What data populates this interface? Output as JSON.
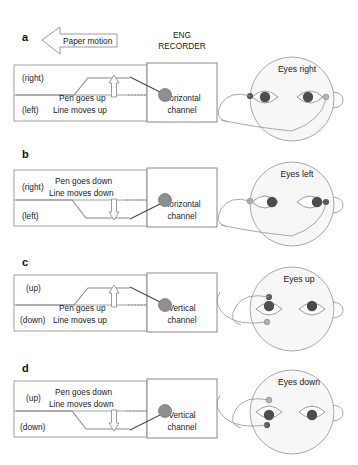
{
  "figure": {
    "recorder_title_line1": "ENG",
    "recorder_title_line2": "RECORDER",
    "paper_motion_label": "Paper motion",
    "colors": {
      "stroke": "#8a8a8a",
      "head_fill": "#f7f7f7",
      "pupil": "#4d4d4d",
      "electrode_active": "#5a5a5a",
      "electrode_inactive": "#b4b4b4",
      "pen_dot": "#8f8f8f",
      "background": "#ffffff"
    }
  },
  "panels": [
    {
      "letter": "a",
      "top_label": "(right)",
      "bottom_label": "(left)",
      "caption_line1": "Pen goes up",
      "caption_line2": "Line moves up",
      "channel_line1": "Horizontal",
      "channel_line2": "channel",
      "head_label": "Eyes right",
      "direction": "up",
      "channel": "horizontal",
      "gaze": "right"
    },
    {
      "letter": "b",
      "top_label": "(right)",
      "bottom_label": "(left)",
      "caption_line1": "Pen goes down",
      "caption_line2": "Line moves down",
      "channel_line1": "Horizontal",
      "channel_line2": "channel",
      "head_label": "Eyes left",
      "direction": "down",
      "channel": "horizontal",
      "gaze": "left"
    },
    {
      "letter": "c",
      "top_label": "(up)",
      "bottom_label": "(down)",
      "caption_line1": "Pen goes up",
      "caption_line2": "Line moves up",
      "channel_line1": "Vertical",
      "channel_line2": "channel",
      "head_label": "Eyes up",
      "direction": "up",
      "channel": "vertical",
      "gaze": "up"
    },
    {
      "letter": "d",
      "top_label": "(up)",
      "bottom_label": "(down)",
      "caption_line1": "Pen goes down",
      "caption_line2": "Line moves down",
      "channel_line1": "Vertical",
      "channel_line2": "channel",
      "head_label": "Eyes down",
      "direction": "down",
      "channel": "vertical",
      "gaze": "down"
    }
  ]
}
